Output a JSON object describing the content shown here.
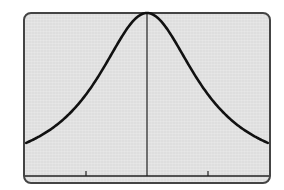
{
  "chart_data": {
    "type": "line",
    "title": "",
    "xlabel": "",
    "ylabel": "",
    "function": "y = 1/(1+x^2)",
    "xlim": [
      -2,
      2
    ],
    "ylim": [
      0,
      1.05
    ],
    "x_ticks": [
      -1,
      1
    ],
    "x_tick_labels": [],
    "grid": false,
    "legend": null,
    "series": [
      {
        "name": "curve",
        "x": [
          -2,
          -1.5,
          -1,
          -0.5,
          0,
          0.5,
          1,
          1.5,
          2
        ],
        "values": [
          0.2,
          0.31,
          0.5,
          0.8,
          1.0,
          0.8,
          0.5,
          0.31,
          0.2
        ]
      }
    ]
  },
  "display": {
    "frame_color": "#444444",
    "background_color": "#dedede",
    "curve_color": "#111111"
  }
}
